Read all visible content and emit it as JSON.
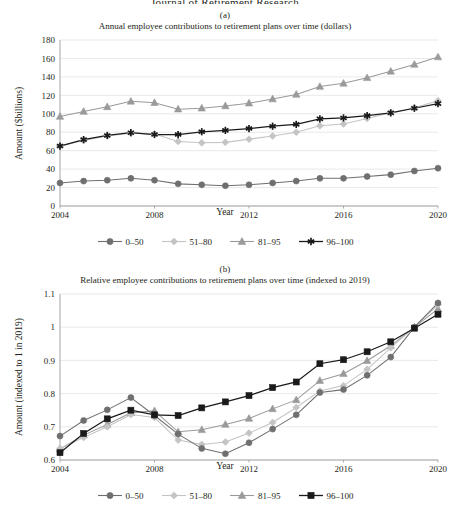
{
  "page": {
    "cut_off_header": "Journal of Retirement Research"
  },
  "panels": [
    {
      "label": "(a)",
      "title": "Annual employee contributions to retirement plans over time (dollars)",
      "ylabel": "Amount ($billions)",
      "xlabel": "Year"
    },
    {
      "label": "(b)",
      "title": "Relative employee contributions to retirement plans over time (indexed to 2019)",
      "ylabel": "Amount (indexed to 1 in 2019)",
      "xlabel": "Year"
    }
  ],
  "legend": [
    {
      "label": "0–50",
      "marker": "circle",
      "color": "#6f6f6f"
    },
    {
      "label": "51–80",
      "marker": "diamond",
      "color": "#c4c4c4"
    },
    {
      "label": "81–95",
      "marker": "triangle",
      "color": "#9a9a9a"
    },
    {
      "label": "96–100",
      "marker": "asterisk",
      "color": "#1a1a1a"
    }
  ],
  "legend_b": [
    {
      "label": "0–50",
      "marker": "circle",
      "color": "#6f6f6f"
    },
    {
      "label": "51–80",
      "marker": "diamond",
      "color": "#c4c4c4"
    },
    {
      "label": "81–95",
      "marker": "triangle",
      "color": "#9a9a9a"
    },
    {
      "label": "96–100",
      "marker": "square",
      "color": "#1a1a1a"
    }
  ],
  "chart_data": [
    {
      "type": "line",
      "panel": "(a)",
      "title": "Annual employee contributions to retirement plans over time (dollars)",
      "xlabel": "Year",
      "ylabel": "Amount ($billions)",
      "x": [
        2004,
        2005,
        2006,
        2007,
        2008,
        2009,
        2010,
        2011,
        2012,
        2013,
        2014,
        2015,
        2016,
        2017,
        2018,
        2019,
        2020
      ],
      "xticks": [
        2004,
        2008,
        2012,
        2016,
        2020
      ],
      "yticks": [
        0,
        20,
        40,
        60,
        80,
        100,
        120,
        140,
        160,
        180
      ],
      "xlim": [
        2004,
        2020
      ],
      "ylim": [
        0,
        180
      ],
      "grid": "horizontal",
      "legend_position": "bottom",
      "series": [
        {
          "name": "0–50",
          "marker": "circle",
          "color": "#6f6f6f",
          "values": [
            25,
            27,
            28,
            30,
            28,
            24,
            23,
            22,
            23,
            25,
            27,
            30,
            30,
            32,
            34,
            38,
            41
          ]
        },
        {
          "name": "51–80",
          "marker": "diamond",
          "color": "#c4c4c4",
          "values": [
            65,
            71,
            76,
            79,
            78,
            70,
            68.5,
            69,
            72.5,
            76,
            80,
            87,
            89,
            95,
            101,
            106.5,
            114
          ]
        },
        {
          "name": "81–95",
          "marker": "triangle",
          "color": "#9a9a9a",
          "values": [
            97,
            102.5,
            107.5,
            113.5,
            112,
            105,
            106,
            108.5,
            111.5,
            116,
            121,
            129.5,
            133,
            139,
            146,
            153.5,
            161.5
          ]
        },
        {
          "name": "96–100",
          "marker": "asterisk",
          "color": "#1a1a1a",
          "values": [
            65,
            72,
            76.5,
            79.5,
            77.5,
            77.5,
            80.5,
            82,
            84,
            86.5,
            88.5,
            94.5,
            95.5,
            98,
            101,
            106,
            111
          ]
        }
      ]
    },
    {
      "type": "line",
      "panel": "(b)",
      "title": "Relative employee contributions to retirement plans over time (indexed to 2019)",
      "xlabel": "Year",
      "ylabel": "Amount (indexed to 1 in 2019)",
      "x": [
        2004,
        2005,
        2006,
        2007,
        2008,
        2009,
        2010,
        2011,
        2012,
        2013,
        2014,
        2015,
        2016,
        2017,
        2018,
        2019,
        2020
      ],
      "xticks": [
        2004,
        2008,
        2012,
        2016,
        2020
      ],
      "yticks": [
        0.6,
        0.7,
        0.8,
        0.9,
        1.0,
        1.1
      ],
      "xlim": [
        2004,
        2020
      ],
      "ylim": [
        0.6,
        1.1
      ],
      "grid": "horizontal",
      "legend_position": "bottom",
      "series": [
        {
          "name": "0–50",
          "marker": "circle",
          "color": "#6f6f6f",
          "values": [
            0.672,
            0.719,
            0.751,
            0.788,
            0.734,
            0.678,
            0.635,
            0.619,
            0.652,
            0.693,
            0.736,
            0.803,
            0.812,
            0.855,
            0.91,
            1.0,
            1.073
          ]
        },
        {
          "name": "51–80",
          "marker": "diamond",
          "color": "#c4c4c4",
          "values": [
            0.635,
            0.668,
            0.7,
            0.737,
            0.728,
            0.66,
            0.647,
            0.654,
            0.681,
            0.713,
            0.758,
            0.808,
            0.824,
            0.873,
            0.938,
            1.0,
            1.068
          ]
        },
        {
          "name": "81–95",
          "marker": "triangle",
          "color": "#9a9a9a",
          "values": [
            0.633,
            0.675,
            0.707,
            0.742,
            0.748,
            0.685,
            0.691,
            0.707,
            0.725,
            0.754,
            0.781,
            0.839,
            0.86,
            0.899,
            0.944,
            1.0,
            1.055
          ]
        },
        {
          "name": "96–100",
          "marker": "square",
          "color": "#1a1a1a",
          "values": [
            0.622,
            0.68,
            0.724,
            0.75,
            0.736,
            0.734,
            0.757,
            0.775,
            0.794,
            0.818,
            0.835,
            0.89,
            0.902,
            0.926,
            0.956,
            0.997,
            1.039
          ]
        }
      ]
    }
  ]
}
